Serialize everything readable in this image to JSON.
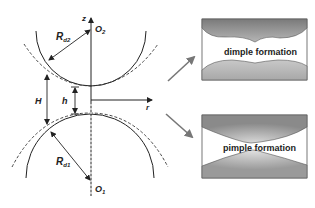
{
  "diagram": {
    "labels": {
      "z_axis": "z",
      "r_axis": "r",
      "upper_center": "O",
      "upper_center_sub": "2",
      "lower_center": "O",
      "lower_center_sub": "1",
      "upper_radius": "R",
      "upper_radius_sub": "d2",
      "lower_radius": "R",
      "lower_radius_sub": "d1",
      "center_distance_gap": "H",
      "film_gap": "h"
    },
    "insets": [
      {
        "id": "dimple",
        "caption": "dimple formation"
      },
      {
        "id": "pimple",
        "caption": "pimple formation"
      }
    ],
    "colors": {
      "line": "#222222",
      "arrow_gray": "#777777",
      "fill_dark": "#8c8c8c",
      "fill_light": "#c8c8c8",
      "box_border": "#555555"
    }
  }
}
